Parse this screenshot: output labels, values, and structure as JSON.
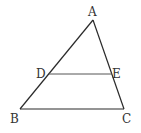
{
  "diagram": {
    "type": "geometry-triangle",
    "colors": {
      "line": "#2a2a2a",
      "segment_de": "#555555",
      "label": "#333333",
      "background": "#ffffff"
    },
    "points": {
      "A": {
        "label": "A",
        "x": 93,
        "y": 20
      },
      "B": {
        "label": "B",
        "x": 20,
        "y": 109
      },
      "C": {
        "label": "C",
        "x": 124,
        "y": 109
      },
      "D": {
        "label": "D",
        "x": 49,
        "y": 74
      },
      "E": {
        "label": "E",
        "x": 112,
        "y": 74
      }
    },
    "segments": [
      "AB",
      "AC",
      "BC",
      "DE"
    ]
  }
}
